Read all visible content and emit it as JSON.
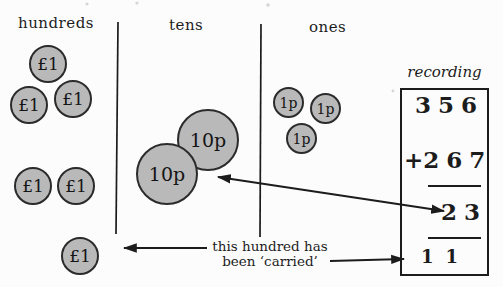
{
  "columns": [
    {
      "id": "hundreds",
      "label": "hundreds"
    },
    {
      "id": "tens",
      "label": "tens"
    },
    {
      "id": "ones",
      "label": "ones"
    }
  ],
  "coins": {
    "hundreds": [
      "£1",
      "£1",
      "£1",
      "£1",
      "£1",
      "£1"
    ],
    "tens": [
      "10p",
      "10p"
    ],
    "ones": [
      "1p",
      "1p",
      "1p"
    ]
  },
  "recording": {
    "label": "recording",
    "addend_top": "356",
    "plus_sign": "+",
    "addend_bottom": "267",
    "partial_sum": "23",
    "carry_digits": "11"
  },
  "annotation": {
    "line1": "this hundred has",
    "line2": "been ‘carried’"
  },
  "colors": {
    "coin_fill": "#b9b9b9",
    "coin_border": "#2b2b2b",
    "ink": "#1c1c1c",
    "background": "#fcfcfc"
  }
}
